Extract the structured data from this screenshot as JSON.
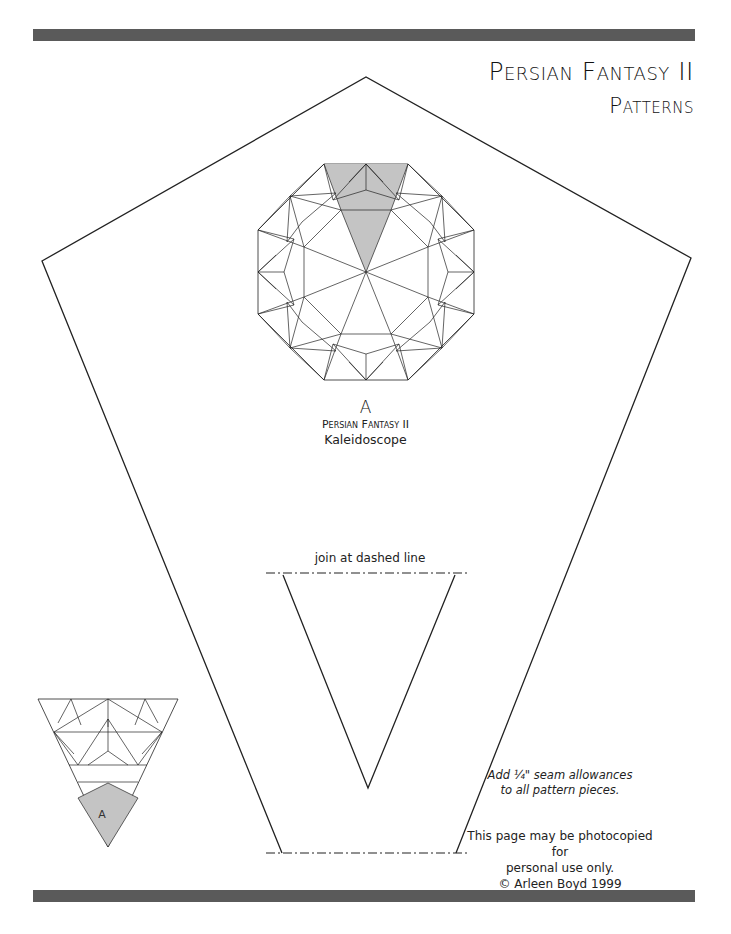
{
  "header": {
    "title": "Persian Fantasy II",
    "subtitle": "Patterns"
  },
  "kaleidoscope": {
    "block_letter": "A",
    "pattern_name": "Persian Fantasy II",
    "description": "Kaleidoscope"
  },
  "template": {
    "join_label": "join at dashed line",
    "piece_label": "A"
  },
  "notes": {
    "seam_line1": "Add ¼\" seam allowances",
    "seam_line2": "to all pattern pieces.",
    "copy_line1": "This page may be photocopied for",
    "copy_line2": "personal use only.",
    "copy_line3": "© Arleen Boyd 1999"
  },
  "colors": {
    "bar": "#5a5a5a",
    "shade": "#c4c4c4",
    "line": "#222222"
  }
}
